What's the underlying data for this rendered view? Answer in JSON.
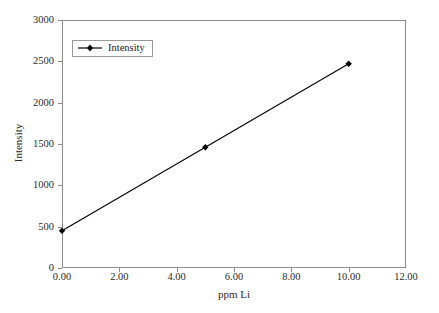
{
  "chart_data": {
    "type": "line",
    "title": "",
    "xlabel": "ppm Li",
    "ylabel": "Intensity",
    "x": [
      0,
      5,
      10
    ],
    "series": [
      {
        "name": "Intensity",
        "values": [
          450,
          1460,
          2470
        ],
        "color": "#000000",
        "marker": "diamond"
      }
    ],
    "xlim": [
      0,
      12
    ],
    "ylim": [
      0,
      3000
    ],
    "xticks": [
      0,
      2,
      4,
      6,
      8,
      10,
      12
    ],
    "xtick_labels": [
      "0.00",
      "2.00",
      "4.00",
      "6.00",
      "8.00",
      "10.00",
      "12.00"
    ],
    "yticks": [
      0,
      500,
      1000,
      1500,
      2000,
      2500,
      3000
    ],
    "ytick_labels": [
      "0",
      "500",
      "1000",
      "1500",
      "2000",
      "2500",
      "3000"
    ],
    "grid": false,
    "legend": {
      "position": "upper-left-inside",
      "entries": [
        "Intensity"
      ]
    },
    "frame_color": "#8c8c8c",
    "background": "#ffffff"
  }
}
